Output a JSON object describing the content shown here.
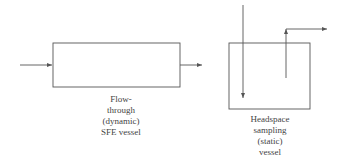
{
  "colors": {
    "line": "#555555",
    "text": "#444444",
    "background": "#ffffff"
  },
  "vessels": [
    {
      "id": "flow-through",
      "label_lines": [
        "Flow-",
        "through",
        "(dynamic)",
        "SFE vessel"
      ]
    },
    {
      "id": "headspace",
      "label_lines": [
        "Headspace",
        "sampling",
        "(static)",
        "vessel"
      ]
    }
  ]
}
